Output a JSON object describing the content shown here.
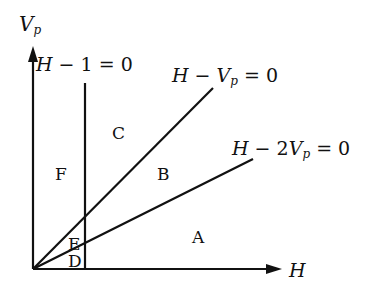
{
  "diagram": {
    "axes": {
      "y_label_main": "V",
      "y_label_sub": "p",
      "x_label": "H"
    },
    "lines": [
      {
        "id": "h-minus-1",
        "parts": [
          "H",
          " − 1 = 0"
        ]
      },
      {
        "id": "h-minus-vp",
        "parts": [
          "H",
          " − ",
          "V",
          "p",
          " = 0"
        ]
      },
      {
        "id": "h-minus-2vp",
        "parts": [
          "H",
          " − 2",
          "V",
          "p",
          " = 0"
        ]
      }
    ],
    "regions": [
      "A",
      "B",
      "C",
      "D",
      "E",
      "F"
    ],
    "colors": {
      "ink": "#111111",
      "background": "#ffffff"
    }
  }
}
